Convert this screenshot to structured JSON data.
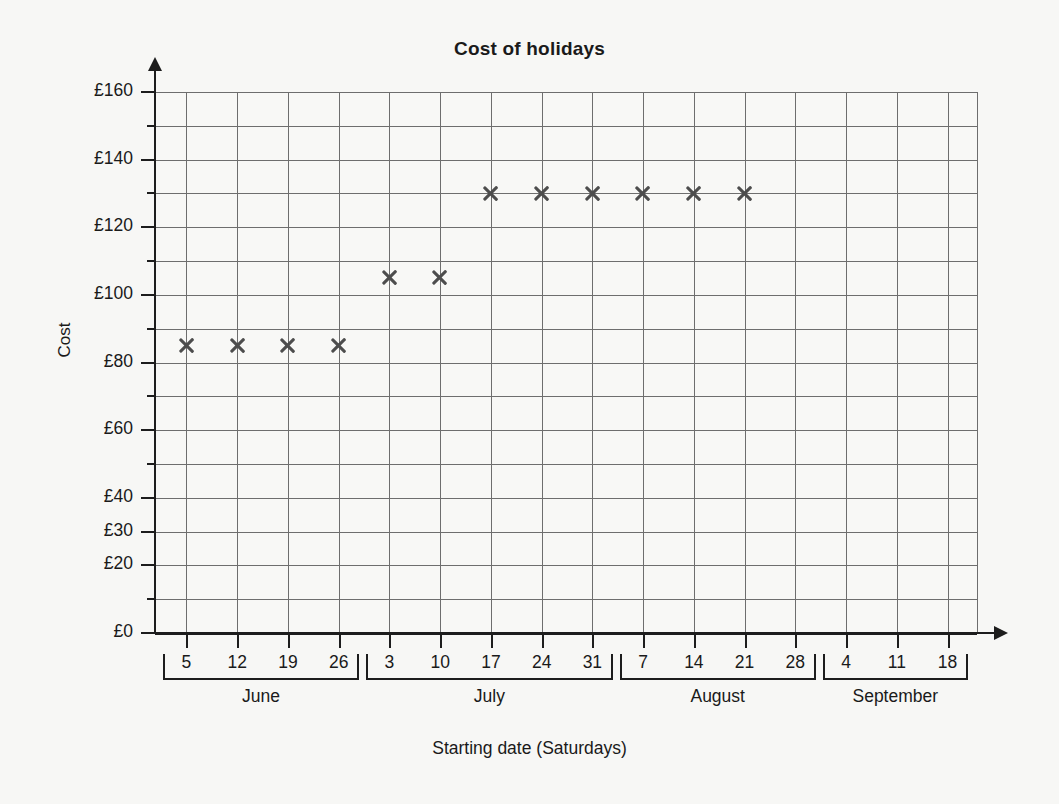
{
  "chart_data": {
    "type": "scatter",
    "title": "Cost of holidays",
    "xlabel": "Starting date (Saturdays)",
    "ylabel": "Cost",
    "grid": true,
    "legend_position": "none",
    "ylim": [
      0,
      160
    ],
    "y_tick_step": 10,
    "y_tick_labels": [
      {
        "value": 160,
        "label": "£160",
        "major": true
      },
      {
        "value": 150,
        "label": "",
        "major": false
      },
      {
        "value": 140,
        "label": "£140",
        "major": true
      },
      {
        "value": 130,
        "label": "",
        "major": false
      },
      {
        "value": 120,
        "label": "£120",
        "major": true
      },
      {
        "value": 110,
        "label": "",
        "major": false
      },
      {
        "value": 100,
        "label": "£100",
        "major": true
      },
      {
        "value": 90,
        "label": "",
        "major": false
      },
      {
        "value": 80,
        "label": "£80",
        "major": true
      },
      {
        "value": 70,
        "label": "",
        "major": false
      },
      {
        "value": 60,
        "label": "£60",
        "major": true
      },
      {
        "value": 50,
        "label": "",
        "major": false
      },
      {
        "value": 40,
        "label": "£40",
        "major": true
      },
      {
        "value": 30,
        "label": "£30",
        "major": true
      },
      {
        "value": 20,
        "label": "£20",
        "major": true
      },
      {
        "value": 10,
        "label": "",
        "major": false
      },
      {
        "value": 0,
        "label": "£0",
        "major": true
      }
    ],
    "categories": [
      "5",
      "12",
      "19",
      "26",
      "3",
      "10",
      "17",
      "24",
      "31",
      "7",
      "14",
      "21",
      "28",
      "4",
      "11",
      "18"
    ],
    "months": [
      {
        "name": "June",
        "dates": [
          "5",
          "12",
          "19",
          "26"
        ]
      },
      {
        "name": "July",
        "dates": [
          "3",
          "10",
          "17",
          "24",
          "31"
        ]
      },
      {
        "name": "August",
        "dates": [
          "7",
          "14",
          "21",
          "28"
        ]
      },
      {
        "name": "September",
        "dates": [
          "4",
          "11",
          "18"
        ]
      }
    ],
    "values": [
      85,
      85,
      85,
      85,
      105,
      105,
      130,
      130,
      130,
      130,
      130,
      130,
      null,
      null,
      null,
      null
    ],
    "points": [
      {
        "month": "June",
        "date": "5",
        "cost": 85
      },
      {
        "month": "June",
        "date": "12",
        "cost": 85
      },
      {
        "month": "June",
        "date": "19",
        "cost": 85
      },
      {
        "month": "June",
        "date": "26",
        "cost": 85
      },
      {
        "month": "July",
        "date": "3",
        "cost": 105
      },
      {
        "month": "July",
        "date": "10",
        "cost": 105
      },
      {
        "month": "July",
        "date": "17",
        "cost": 130
      },
      {
        "month": "July",
        "date": "24",
        "cost": 130
      },
      {
        "month": "July",
        "date": "31",
        "cost": 130
      },
      {
        "month": "August",
        "date": "7",
        "cost": 130
      },
      {
        "month": "August",
        "date": "14",
        "cost": 130
      },
      {
        "month": "August",
        "date": "21",
        "cost": 130
      },
      {
        "month": "August",
        "date": "28",
        "cost": null
      },
      {
        "month": "September",
        "date": "4",
        "cost": null
      },
      {
        "month": "September",
        "date": "11",
        "cost": null
      },
      {
        "month": "September",
        "date": "18",
        "cost": null
      }
    ],
    "marker_style": "x",
    "colors": {
      "marker": "#4d4d4d",
      "grid": "#6e6e6e",
      "axis": "#1d1d1d",
      "background": "#f7f7f5",
      "text": "#1a1a1a"
    }
  }
}
